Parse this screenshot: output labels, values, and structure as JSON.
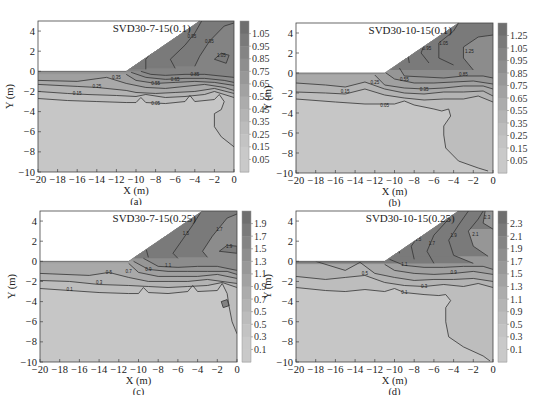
{
  "chart_data": [
    {
      "type": "heatmap",
      "panel_label": "(a)",
      "title": "SVD30-7-15(0.1)",
      "xlabel": "X (m)",
      "ylabel": "Y (m)",
      "xlim": [
        -20,
        0
      ],
      "ylim": [
        -10,
        5
      ],
      "xticks": [
        "-20",
        "-18",
        "-16",
        "-14",
        "-12",
        "-10",
        "-8",
        "-6",
        "-4",
        "-2",
        "0"
      ],
      "yticks": [
        "4",
        "2",
        "0",
        "-2",
        "-4",
        "-6",
        "-8",
        "-10"
      ],
      "colorbar_ticks": [
        "1.05",
        "0.95",
        "0.85",
        "0.75",
        "0.65",
        "0.55",
        "0.45",
        "0.35",
        "0.25",
        "0.15",
        "0.05"
      ],
      "contour_levels": [
        "0.05",
        "0.15",
        "0.25",
        "0.35",
        "0.45",
        "0.55",
        "0.65",
        "0.75",
        "0.85",
        "0.95",
        "1.05"
      ],
      "slope": {
        "toe_x": -11,
        "toe_y": 0,
        "crest_x": -3.5,
        "crest_y": 5
      }
    },
    {
      "type": "heatmap",
      "panel_label": "(b)",
      "title": "SVD30-10-15(0.1)",
      "xlabel": "X (m)",
      "ylabel": "Y (m)",
      "xlim": [
        -20,
        0
      ],
      "ylim": [
        -10,
        5
      ],
      "xticks": [
        "-20",
        "-18",
        "-16",
        "-14",
        "-12",
        "-10",
        "-8",
        "-6",
        "-4",
        "-2",
        "0"
      ],
      "yticks": [
        "4",
        "2",
        "0",
        "-2",
        "-4",
        "-6",
        "-8",
        "-10"
      ],
      "colorbar_ticks": [
        "1.25",
        "1.05",
        "0.95",
        "0.85",
        "0.75",
        "0.65",
        "0.55",
        "0.35",
        "0.25",
        "0.15",
        "0.05"
      ],
      "contour_levels": [
        "0.05",
        "0.15",
        "0.25",
        "0.35",
        "0.55",
        "0.65",
        "0.75",
        "0.85",
        "0.95",
        "1.05",
        "1.25"
      ],
      "slope": {
        "toe_x": -11,
        "toe_y": 0,
        "crest_x": -3.5,
        "crest_y": 5
      }
    },
    {
      "type": "heatmap",
      "panel_label": "(c)",
      "title": "SVD30-7-15(0.25)",
      "xlabel": "X (m)",
      "ylabel": "Y (m)",
      "xlim": [
        -20,
        0
      ],
      "ylim": [
        -10,
        5
      ],
      "xticks": [
        "-20",
        "-18",
        "-16",
        "-14",
        "-12",
        "-10",
        "-8",
        "-6",
        "-4",
        "-2",
        "0"
      ],
      "yticks": [
        "4",
        "2",
        "0",
        "-2",
        "-4",
        "-6",
        "-8",
        "-10"
      ],
      "colorbar_ticks": [
        "1.9",
        "1.7",
        "1.5",
        "1.3",
        "1.1",
        "0.9",
        "0.7",
        "0.5",
        "0.5",
        "0.3",
        "0.1"
      ],
      "contour_levels": [
        "0.1",
        "0.3",
        "0.5",
        "0.7",
        "0.9",
        "1.1",
        "1.3",
        "1.5",
        "1.7",
        "1.9"
      ],
      "slope": {
        "toe_x": -11,
        "toe_y": 0,
        "crest_x": -3.5,
        "crest_y": 5
      }
    },
    {
      "type": "heatmap",
      "panel_label": "(d)",
      "title": "SVD30-10-15(0.25)",
      "xlabel": "X (m)",
      "ylabel": "Y (m)",
      "xlim": [
        -20,
        0
      ],
      "ylim": [
        -10,
        5
      ],
      "xticks": [
        "-20",
        "-18",
        "-16",
        "-14",
        "-12",
        "-10",
        "-8",
        "-6",
        "-4",
        "-2",
        "0"
      ],
      "yticks": [
        "4",
        "2",
        "0",
        "-2",
        "-4",
        "-6",
        "-8",
        "-10"
      ],
      "colorbar_ticks": [
        "2.3",
        "2.1",
        "1.9",
        "1.7",
        "1.5",
        "1.3",
        "1.1",
        "0.9",
        "0.5",
        "0.3",
        "0.1"
      ],
      "contour_levels": [
        "0.1",
        "0.3",
        "0.5",
        "0.7",
        "0.9",
        "1.1",
        "1.3",
        "1.5",
        "1.7",
        "1.9",
        "2.1",
        "2.3"
      ],
      "slope": {
        "toe_x": -11,
        "toe_y": 0,
        "crest_x": -3.5,
        "crest_y": 5
      }
    }
  ],
  "colors": {
    "low": "#c9c9c9",
    "mid": "#a8a8a8",
    "high": "#7a7a7a",
    "contour_line": "#333333",
    "frame": "#444444"
  }
}
